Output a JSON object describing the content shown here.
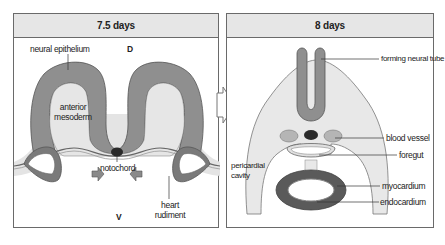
{
  "figure": {
    "panels": [
      {
        "title": "7.5 days",
        "axis_labels": {
          "dorsal": "D",
          "ventral": "V"
        },
        "labels": {
          "neural_epithelium": "neural epithelium",
          "anterior_mesoderm_line1": "anterior",
          "anterior_mesoderm_line2": "mesoderm",
          "notochord": "notochord",
          "heart_rudiment_line1": "heart",
          "heart_rudiment_line2": "rudiment"
        }
      },
      {
        "title": "8 days",
        "labels": {
          "forming_neural_tube": "forming neural tube",
          "blood_vessel": "blood vessel",
          "foregut": "foregut",
          "pericardial_cavity_line1": "pericardial",
          "pericardial_cavity_line2": "cavity",
          "myocardium": "myocardium",
          "endocardium": "endocardium"
        }
      }
    ],
    "colors": {
      "neural_tissue": "#8f8f8f",
      "mesoderm": "#e6e6e6",
      "notochord": "#2a2a2a",
      "myocardium": "#5a5a5a",
      "outline": "#555555",
      "header_bg": "#e6e6e6"
    }
  }
}
